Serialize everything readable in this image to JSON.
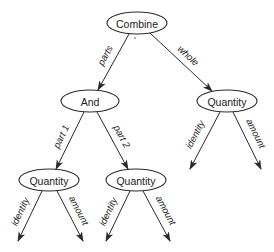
{
  "diagram": {
    "type": "tree",
    "colors": {
      "stroke": "#2a2a2a",
      "text": "#222222",
      "background": "#ffffff"
    },
    "nodes": [
      {
        "id": "combine",
        "label": "Combine",
        "cx": 137,
        "cy": 23,
        "rx": 30,
        "ry": 11
      },
      {
        "id": "and",
        "label": "And",
        "cx": 90,
        "cy": 101,
        "rx": 29,
        "ry": 11
      },
      {
        "id": "quantity_right",
        "label": "Quantity",
        "cx": 227,
        "cy": 101,
        "rx": 30,
        "ry": 11
      },
      {
        "id": "quantity_left",
        "label": "Quantity",
        "cx": 49,
        "cy": 180,
        "rx": 30,
        "ry": 11
      },
      {
        "id": "quantity_mid",
        "label": "Quantity",
        "cx": 136,
        "cy": 180,
        "rx": 30,
        "ry": 11
      }
    ],
    "edges": [
      {
        "id": "e_parts",
        "from": "combine",
        "to": "and",
        "label": "parts",
        "x1": 129,
        "y1": 34,
        "x2": 98,
        "y2": 90,
        "lx": 108,
        "ly": 57
      },
      {
        "id": "e_whole",
        "from": "combine",
        "to": "quantity_right",
        "label": "whole",
        "x1": 150,
        "y1": 33,
        "x2": 212,
        "y2": 91,
        "lx": 186,
        "ly": 58
      },
      {
        "id": "e_part1",
        "from": "and",
        "to": "quantity_left",
        "label": "part 1",
        "x1": 84,
        "y1": 112,
        "x2": 56,
        "y2": 169,
        "lx": 64,
        "ly": 138
      },
      {
        "id": "e_part2",
        "from": "and",
        "to": "quantity_mid",
        "label": "part 2",
        "x1": 97,
        "y1": 112,
        "x2": 128,
        "y2": 169,
        "lx": 119,
        "ly": 138
      },
      {
        "id": "e_left_identity",
        "from": "quantity_left",
        "to": null,
        "label": "identity",
        "x1": 42,
        "y1": 191,
        "x2": 18,
        "y2": 241,
        "lx": 23,
        "ly": 213
      },
      {
        "id": "e_left_amount",
        "from": "quantity_left",
        "to": null,
        "label": "amount",
        "x1": 57,
        "y1": 191,
        "x2": 83,
        "y2": 241,
        "lx": 76,
        "ly": 212
      },
      {
        "id": "e_mid_identity",
        "from": "quantity_mid",
        "to": null,
        "label": "identity",
        "x1": 130,
        "y1": 191,
        "x2": 106,
        "y2": 241,
        "lx": 111,
        "ly": 213
      },
      {
        "id": "e_mid_amount",
        "from": "quantity_mid",
        "to": null,
        "label": "amount",
        "x1": 143,
        "y1": 191,
        "x2": 170,
        "y2": 241,
        "lx": 163,
        "ly": 212
      },
      {
        "id": "e_right_identity",
        "from": "quantity_right",
        "to": null,
        "label": "identity",
        "x1": 220,
        "y1": 112,
        "x2": 190,
        "y2": 169,
        "lx": 198,
        "ly": 136
      },
      {
        "id": "e_right_amount",
        "from": "quantity_right",
        "to": null,
        "label": "amount",
        "x1": 233,
        "y1": 112,
        "x2": 261,
        "y2": 169,
        "lx": 253,
        "ly": 135
      }
    ]
  }
}
